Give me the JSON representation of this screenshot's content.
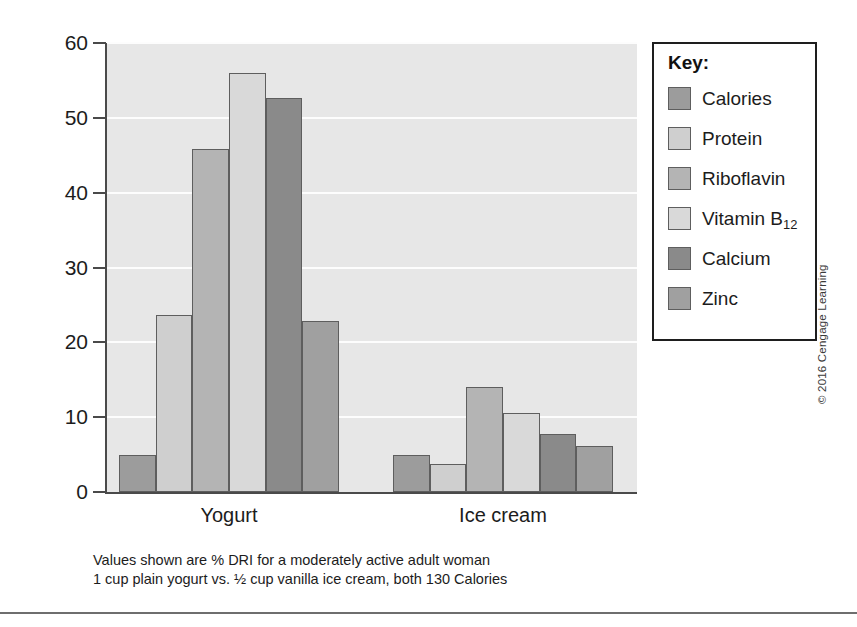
{
  "chart_data": {
    "type": "bar",
    "title": "",
    "xlabel": "",
    "ylabel": "",
    "ylim": [
      0,
      60
    ],
    "ytick_labels": [
      "60",
      "50",
      "40",
      "30",
      "20",
      "10",
      "0"
    ],
    "ytick_values": [
      60,
      50,
      40,
      30,
      20,
      10,
      0
    ],
    "grid": true,
    "grid_color": "#fdfdfd",
    "plot_background": "#e7e7e7",
    "legend_position": "right",
    "legend_title": "Key:",
    "categories": [
      "Yogurt",
      "Ice cream"
    ],
    "series": [
      {
        "name": "Calories",
        "color": "#9c9c9c",
        "values": [
          5.0,
          5.0
        ]
      },
      {
        "name": "Protein",
        "color": "#cfcfcf",
        "values": [
          23.7,
          3.7
        ]
      },
      {
        "name": "Riboflavin",
        "color": "#b4b4b4",
        "values": [
          45.8,
          14.0
        ]
      },
      {
        "name": "Vitamin B12",
        "color": "#d9d9d9",
        "values": [
          56.0,
          10.6
        ]
      },
      {
        "name": "Calcium",
        "color": "#8a8a8a",
        "values": [
          52.6,
          7.7
        ]
      },
      {
        "name": "Zinc",
        "color": "#a0a0a0",
        "values": [
          22.9,
          6.1
        ]
      }
    ],
    "annotations": [
      "Values shown are % DRI for a moderately active adult woman",
      "1 cup plain yogurt vs. ½ cup vanilla ice cream, both 130 Calories"
    ]
  },
  "legend": {
    "title": "Key:",
    "items": [
      {
        "label": "Calories",
        "color": "#9c9c9c"
      },
      {
        "label": "Protein",
        "color": "#cfcfcf"
      },
      {
        "label": "Riboflavin",
        "color": "#b4b4b4"
      },
      {
        "label": "Vitamin B",
        "sub": "12",
        "color": "#d9d9d9"
      },
      {
        "label": "Calcium",
        "color": "#8a8a8a"
      },
      {
        "label": "Zinc",
        "color": "#a0a0a0"
      }
    ]
  },
  "caption": {
    "line1": "Values shown are % DRI for a moderately active adult woman",
    "line2": "1 cup plain yogurt vs. ½ cup vanilla ice cream, both 130 Calories"
  },
  "copyright": "© 2016 Cengage Learning"
}
